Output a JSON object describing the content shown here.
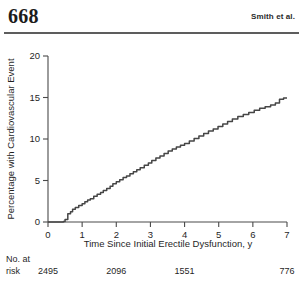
{
  "header": {
    "folio": "668",
    "running_title": "Smith et al."
  },
  "chart_data": {
    "type": "line",
    "subtype": "kaplan-meier-cumulative-incidence",
    "title": "",
    "xlabel": "Time Since Initial Erectile Dysfunction, y",
    "ylabel": "Percentage with Cardiovascular Event",
    "xlim": [
      0,
      7
    ],
    "ylim": [
      0,
      20
    ],
    "xticks": [
      0,
      1,
      2,
      3,
      4,
      5,
      6,
      7
    ],
    "xticklabels": [
      "0",
      "1",
      "2",
      "3",
      "4",
      "5",
      "6",
      "7"
    ],
    "yticks": [
      0,
      5,
      10,
      15,
      20
    ],
    "yticklabels": [
      "0",
      "5",
      "10",
      "15",
      "20"
    ],
    "grid": false,
    "legend": null,
    "line_color": "#464646",
    "series": [
      {
        "name": "Cumulative cardiovascular events",
        "x": [
          0.0,
          0.45,
          0.5,
          0.58,
          0.66,
          0.72,
          0.8,
          0.9,
          1.0,
          1.08,
          1.16,
          1.24,
          1.34,
          1.44,
          1.54,
          1.62,
          1.72,
          1.82,
          1.9,
          2.0,
          2.1,
          2.2,
          2.3,
          2.4,
          2.5,
          2.6,
          2.7,
          2.82,
          2.94,
          3.04,
          3.16,
          3.28,
          3.4,
          3.52,
          3.64,
          3.76,
          3.88,
          4.0,
          4.14,
          4.28,
          4.42,
          4.56,
          4.7,
          4.84,
          4.98,
          5.12,
          5.26,
          5.4,
          5.56,
          5.72,
          5.88,
          6.04,
          6.2,
          6.36,
          6.52,
          6.66,
          6.78,
          6.9,
          7.0
        ],
        "y": [
          0.0,
          0.05,
          0.3,
          1.0,
          1.25,
          1.55,
          1.75,
          2.0,
          2.2,
          2.45,
          2.65,
          2.8,
          3.1,
          3.35,
          3.55,
          3.8,
          4.05,
          4.3,
          4.6,
          4.85,
          5.1,
          5.35,
          5.55,
          5.8,
          6.05,
          6.3,
          6.55,
          6.85,
          7.1,
          7.4,
          7.7,
          7.95,
          8.25,
          8.55,
          8.8,
          9.05,
          9.25,
          9.45,
          9.75,
          10.05,
          10.35,
          10.65,
          10.95,
          11.2,
          11.5,
          11.8,
          12.1,
          12.4,
          12.7,
          12.95,
          13.2,
          13.45,
          13.7,
          13.9,
          14.1,
          14.35,
          14.8,
          14.95,
          14.95
        ]
      }
    ],
    "risk_table": {
      "label_line1": "No. at",
      "label_line2": "risk",
      "times": [
        0,
        2,
        4,
        7
      ],
      "counts": [
        "2495",
        "2096",
        "1551",
        "776"
      ]
    }
  }
}
